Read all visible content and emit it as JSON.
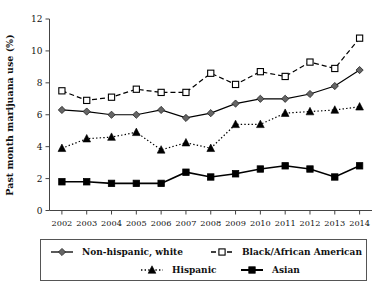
{
  "chart_data": {
    "type": "line",
    "title": "",
    "xlabel": "",
    "ylabel": "Past month marijuana use (%)",
    "categories": [
      "2002",
      "2003",
      "2004",
      "2005",
      "2006",
      "2007",
      "2008",
      "2009",
      "2010",
      "2011",
      "2012",
      "2013",
      "2014"
    ],
    "x": [
      2002,
      2003,
      2004,
      2005,
      2006,
      2007,
      2008,
      2009,
      2010,
      2011,
      2012,
      2013,
      2014
    ],
    "xlim": [
      2001.5,
      2014.5
    ],
    "ylim": [
      0,
      12
    ],
    "yticks": [
      0,
      2,
      4,
      6,
      8,
      10,
      12
    ],
    "grid": false,
    "legend_position": "bottom",
    "series": [
      {
        "name": "Non-hispanic, white",
        "marker": "diamond",
        "marker_fill": "#666666",
        "line_style": "solid",
        "values": [
          6.3,
          6.2,
          6.0,
          6.0,
          6.3,
          5.8,
          6.1,
          6.7,
          7.0,
          7.0,
          7.3,
          7.8,
          8.8
        ]
      },
      {
        "name": "Black/African American",
        "marker": "square-open",
        "marker_fill": "#ffffff",
        "line_style": "dashed",
        "values": [
          7.5,
          6.9,
          7.1,
          7.6,
          7.4,
          7.4,
          8.6,
          7.9,
          8.7,
          8.4,
          9.3,
          8.9,
          10.8
        ]
      },
      {
        "name": "Hispanic",
        "marker": "triangle",
        "marker_fill": "#000000",
        "line_style": "dotted",
        "values": [
          3.9,
          4.5,
          4.6,
          4.9,
          3.8,
          4.25,
          3.9,
          5.4,
          5.4,
          6.1,
          6.2,
          6.3,
          6.5
        ]
      },
      {
        "name": "Asian",
        "marker": "square-filled",
        "marker_fill": "#000000",
        "line_style": "solid",
        "values": [
          1.8,
          1.8,
          1.7,
          1.7,
          1.7,
          2.4,
          2.1,
          2.3,
          2.6,
          2.8,
          2.6,
          2.1,
          2.8
        ]
      }
    ]
  },
  "axes": {
    "y_tick_labels": [
      "0",
      "2",
      "4",
      "6",
      "8",
      "10",
      "12"
    ],
    "x_tick_labels": [
      "2002",
      "2003",
      "2004",
      "2005",
      "2006",
      "2007",
      "2008",
      "2009",
      "2010",
      "2011",
      "2012",
      "2013",
      "2014"
    ],
    "y_axis_title": "Past month marijuana use (%)"
  },
  "legend": {
    "entries": [
      {
        "label": "Non-hispanic, white"
      },
      {
        "label": "Black/African American"
      },
      {
        "label": "Hispanic"
      },
      {
        "label": "Asian"
      }
    ]
  },
  "colors": {
    "axis": "#444444",
    "text": "#111111",
    "white_series": "#666666",
    "black_series": "#000000",
    "hispanic_series": "#000000",
    "asian_series": "#000000",
    "legend_border": "#555555",
    "background": "#ffffff"
  }
}
